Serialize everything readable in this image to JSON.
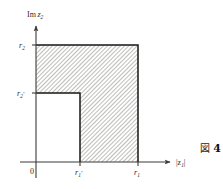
{
  "figure": {
    "caption_glyph": "図",
    "caption_number": "4",
    "axes": {
      "y_label_main": "Im",
      "y_label_var": "z",
      "y_label_var_sub": "2",
      "x_label": "|z",
      "x_label_sub": "1",
      "x_label_close": "|",
      "origin_label": "0"
    },
    "y_ticks": [
      {
        "id": "r2",
        "base": "r",
        "sub": "2",
        "prime": "",
        "value_px": 45
      },
      {
        "id": "r2prime",
        "base": "r",
        "sub": "2",
        "prime": "′",
        "value_px": 93
      }
    ],
    "x_ticks": [
      {
        "id": "r1prime",
        "base": "r",
        "sub": "1",
        "prime": "′",
        "value_px": 80
      },
      {
        "id": "r1",
        "base": "r",
        "sub": "1",
        "prime": "",
        "value_px": 138
      }
    ],
    "region": {
      "description": "hatched L-shaped region",
      "fill": "#d9d9d6",
      "outline_color": "#161616",
      "hatch_color": "#8c8c8a",
      "vertices_px": [
        [
          36,
          45
        ],
        [
          138,
          45
        ],
        [
          138,
          162
        ],
        [
          80,
          162
        ],
        [
          80,
          93
        ],
        [
          36,
          93
        ]
      ]
    },
    "plot_box_px": {
      "x_axis_y": 162,
      "y_axis_x": 36,
      "x_arrow_end": 172,
      "y_arrow_end": 24
    }
  }
}
